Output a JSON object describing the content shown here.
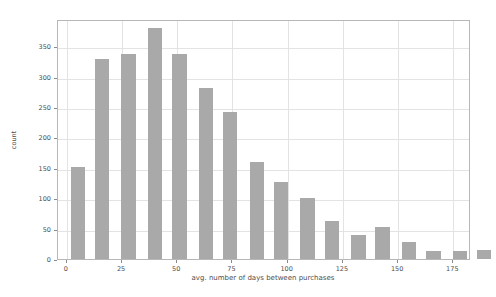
{
  "chart_data": {
    "type": "bar",
    "title": "",
    "subtitle": "",
    "xlabel": "avg. number of days between purchases",
    "ylabel": "count",
    "xlim": [
      -4,
      183
    ],
    "ylim": [
      0,
      395
    ],
    "grid": true,
    "legend": null,
    "bar_color": "#a9a9a9",
    "bin_width": 8.3,
    "xticks": [
      0,
      25,
      50,
      75,
      100,
      125,
      150,
      175
    ],
    "xtick_labels": [
      "0",
      "25",
      "50",
      "75",
      "100",
      "125",
      "150",
      "175"
    ],
    "yticks": [
      0,
      50,
      100,
      150,
      200,
      250,
      300,
      350
    ],
    "ytick_labels": [
      "0",
      "50",
      "100",
      "150",
      "200",
      "250",
      "300",
      "350"
    ],
    "bin_starts": [
      0.8,
      12.4,
      23.9,
      35.5,
      47.0,
      58.6,
      70.1,
      81.7,
      93.2,
      104.8,
      116.3,
      127.9,
      139.4,
      151.0,
      162.5,
      174.1,
      185.6,
      197.2,
      208.7,
      220.3
    ],
    "x": [
      5,
      16,
      28,
      40,
      51,
      63,
      74,
      86,
      97,
      109,
      120,
      132,
      143,
      155,
      166,
      178,
      189,
      201,
      212,
      224
    ],
    "values": [
      152,
      330,
      338,
      381,
      338,
      281,
      242,
      160,
      126,
      100,
      62,
      40,
      52,
      28,
      14,
      14,
      15,
      10,
      10,
      17
    ],
    "categories": [
      "0-9",
      "9-18",
      "18-27",
      "27-36",
      "36-45",
      "45-54",
      "54-63",
      "63-72",
      "72-81",
      "81-90",
      "90-99",
      "99-108",
      "108-117",
      "117-126",
      "126-135",
      "135-144",
      "144-153",
      "153-162",
      "162-171",
      "171-180"
    ]
  },
  "axes": {
    "ylabel": "count",
    "xlabel": "avg. number of days between purchases"
  }
}
